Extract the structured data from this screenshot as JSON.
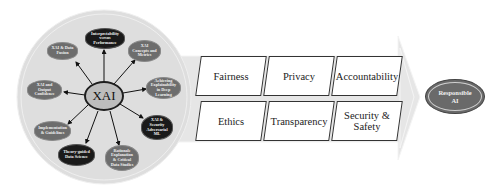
{
  "diagram": {
    "hub": {
      "label": "XAI"
    },
    "spokes": [
      {
        "label": "Interpretability versus Performance",
        "style": "dark"
      },
      {
        "label": "XAI Concepts and Metrics",
        "style": "gray"
      },
      {
        "label": "Achieving Explainability in Deep Learning",
        "style": "gray"
      },
      {
        "label": "XAI & Security Adversarial ML",
        "style": "dark"
      },
      {
        "label": "Rationale Explanation & Critical Data Studies",
        "style": "gray"
      },
      {
        "label": "Theory-guided Data Science",
        "style": "dark"
      },
      {
        "label": "Implementation & Guidelines",
        "style": "gray"
      },
      {
        "label": "XAI and Output Confidence",
        "style": "gray"
      },
      {
        "label": "XAI & Data Fusion",
        "style": "gray"
      }
    ],
    "principles": {
      "top_row": [
        "Fairness",
        "Privacy",
        "Accountability"
      ],
      "bottom_row": [
        "Ethics",
        "Transparency",
        "Security & Safety"
      ]
    },
    "outcome": {
      "label": "Responsible AI"
    },
    "colors": {
      "circle_fill": "#dcdcdc",
      "arrow_fill": "#e4e4e4",
      "dark_node": "#1a1a1a",
      "gray_node": "#6d6d6d",
      "hub_fill": "#bdbdbd",
      "outcome_fill": "#6a6a6a"
    }
  }
}
